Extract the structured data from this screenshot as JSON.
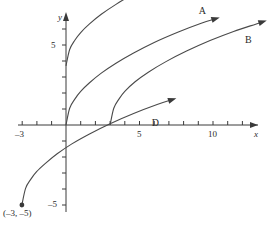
{
  "chart_data": {
    "type": "line",
    "title": "",
    "xlabel": "x",
    "ylabel": "y",
    "xlim": [
      -3.3,
      14.0
    ],
    "ylim": [
      -6.2,
      7.0
    ],
    "grid": false,
    "legend": "inline-curve-labels",
    "x_ticks": [
      -3,
      -2,
      -1,
      0,
      1,
      2,
      3,
      4,
      5,
      6,
      7,
      8,
      9,
      10,
      11,
      12,
      13
    ],
    "x_tick_labels": [
      {
        "value": -3,
        "text": "–3"
      },
      {
        "value": 5,
        "text": "5"
      },
      {
        "value": 10,
        "text": "10"
      }
    ],
    "y_ticks": [
      -5,
      -4,
      -3,
      -2,
      -1,
      1,
      2,
      3,
      4,
      5,
      6
    ],
    "y_tick_labels": [
      {
        "value": 5,
        "text": "5"
      },
      {
        "value": -5,
        "text": "–5"
      }
    ],
    "series": [
      {
        "name": "A",
        "label": "A",
        "description": "square-root curve starting at the origin",
        "start_point": [
          0,
          0
        ],
        "points": [
          [
            0,
            0
          ],
          [
            0.25,
            1.05
          ],
          [
            0.6,
            1.62
          ],
          [
            1,
            2.1
          ],
          [
            1.6,
            2.64
          ],
          [
            2.4,
            3.24
          ],
          [
            3.4,
            3.86
          ],
          [
            4.6,
            4.5
          ],
          [
            6,
            5.16
          ],
          [
            7.6,
            5.8
          ],
          [
            9.2,
            6.36
          ],
          [
            10.1,
            6.62
          ]
        ],
        "label_position": [
          9.3,
          7.1
        ],
        "arrow_end": [
          10.2,
          6.65
        ]
      },
      {
        "name": "B",
        "label": "B",
        "description": "square-root curve shifted right, starting at (3, 0)",
        "start_point": [
          3,
          0
        ],
        "points": [
          [
            3,
            0
          ],
          [
            3.25,
            1.05
          ],
          [
            3.6,
            1.62
          ],
          [
            4,
            2.1
          ],
          [
            4.7,
            2.7
          ],
          [
            5.6,
            3.3
          ],
          [
            6.8,
            3.96
          ],
          [
            8.2,
            4.62
          ],
          [
            9.8,
            5.28
          ],
          [
            11.4,
            5.85
          ],
          [
            12.9,
            6.3
          ],
          [
            13.4,
            6.45
          ]
        ],
        "label_position": [
          12.45,
          5.3
        ],
        "arrow_end": [
          13.4,
          6.45
        ]
      },
      {
        "name": "C",
        "label": "C",
        "description": "square-root curve shifted up, starting at (0, 3.7)",
        "start_point": [
          0,
          3.7
        ],
        "points": [
          [
            0,
            3.7
          ],
          [
            0.25,
            4.72
          ],
          [
            0.6,
            5.3
          ],
          [
            1,
            5.78
          ],
          [
            1.6,
            6.32
          ],
          [
            2.4,
            6.92
          ],
          [
            3.4,
            7.54
          ],
          [
            4.6,
            8.2
          ],
          [
            6,
            8.84
          ],
          [
            7.6,
            9.5
          ],
          [
            9.2,
            10.05
          ],
          [
            10.4,
            10.4
          ]
        ],
        "label_position": [
          9.5,
          9.1
        ],
        "arrow_end": [
          10.4,
          10.4
        ]
      },
      {
        "name": "D",
        "label": "D",
        "description": "square-root curve shifted left and down, starting at the plotted point (–3, –5)",
        "start_point": [
          -3,
          -5
        ],
        "points": [
          [
            -3,
            -5
          ],
          [
            -2.75,
            -3.96
          ],
          [
            -2.4,
            -3.4
          ],
          [
            -2,
            -2.92
          ],
          [
            -1.4,
            -2.4
          ],
          [
            -0.6,
            -1.8
          ],
          [
            0.4,
            -1.18
          ],
          [
            1.6,
            -0.56
          ],
          [
            3,
            0.08
          ],
          [
            4.6,
            0.72
          ],
          [
            6.2,
            1.28
          ],
          [
            7.2,
            1.58
          ]
        ],
        "label_position": [
          6.1,
          0.1
        ],
        "arrow_end": [
          7.25,
          1.6
        ]
      }
    ],
    "annotated_points": [
      {
        "coords": [
          -3,
          -5
        ],
        "label": "(–3, –5)",
        "marker": "filled-dot"
      }
    ]
  },
  "labels": {
    "x_axis": "x",
    "y_axis": "y",
    "x_tick_neg3": "–3",
    "x_tick_5": "5",
    "x_tick_10": "10",
    "y_tick_5": "5",
    "y_tick_neg5": "–5",
    "curve_a": "A",
    "curve_b": "B",
    "curve_c": "C",
    "curve_d": "D",
    "point_label": "(–3, –5)"
  },
  "colors": {
    "axis": "#3a3a3a",
    "curve": "#4a4a4a",
    "text": "#2b2b2b",
    "background": "#ffffff"
  }
}
